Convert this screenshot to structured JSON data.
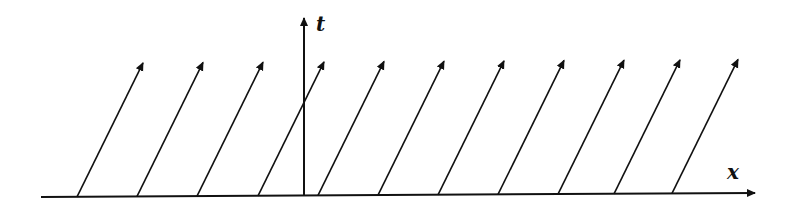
{
  "diagram": {
    "axes": {
      "x_label": "x",
      "t_label": "t"
    },
    "colors": {
      "ink": "#111111",
      "background": "#ffffff"
    },
    "x_axis": {
      "x1": 41,
      "y1": 197,
      "x2": 755,
      "y2": 193
    },
    "t_axis": {
      "x": 304,
      "y_bottom": 196,
      "y_top": 18
    },
    "characteristics": {
      "count": 11,
      "bases_x": [
        77,
        137,
        197,
        258,
        318,
        378,
        438,
        498,
        558,
        614,
        672
      ],
      "dx": 66,
      "dy": 134,
      "description": "parallel arrows rising to the right from the x-axis"
    }
  }
}
